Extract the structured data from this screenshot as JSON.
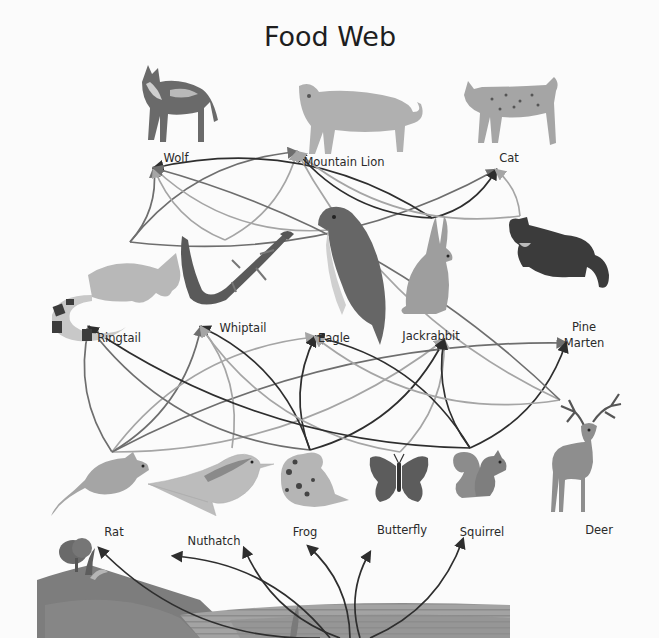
{
  "title": "Food Web",
  "colors": {
    "background": "#fbfbfb",
    "dark": "#3a3a3a",
    "mid": "#777777",
    "light": "#a9a9a9",
    "ground": "#7c7c7c",
    "water": "#9a9a9a"
  },
  "organisms": [
    {
      "id": "wolf",
      "label": "Wolf",
      "level": "top-predator",
      "icon": "wolf-icon"
    },
    {
      "id": "mountain_lion",
      "label": "Mountain Lion",
      "level": "top-predator",
      "icon": "mountain-lion-icon"
    },
    {
      "id": "cat",
      "label": "Cat",
      "level": "top-predator",
      "icon": "cat-icon"
    },
    {
      "id": "ringtail",
      "label": "Ringtail",
      "level": "secondary-consumer",
      "icon": "ringtail-icon"
    },
    {
      "id": "whiptail",
      "label": "Whiptail",
      "level": "secondary-consumer",
      "icon": "whiptail-lizard-icon"
    },
    {
      "id": "eagle",
      "label": "Eagle",
      "level": "secondary-consumer",
      "icon": "eagle-icon"
    },
    {
      "id": "jackrabbit",
      "label": "Jackrabbit",
      "level": "secondary-consumer",
      "icon": "jackrabbit-icon"
    },
    {
      "id": "pine_marten",
      "label": "Pine Marten",
      "label_lines": [
        "Pine",
        "Marten"
      ],
      "level": "secondary-consumer",
      "icon": "pine-marten-icon"
    },
    {
      "id": "rat",
      "label": "Rat",
      "level": "primary-consumer",
      "icon": "rat-icon"
    },
    {
      "id": "nuthatch",
      "label": "Nuthatch",
      "level": "primary-consumer",
      "icon": "nuthatch-icon"
    },
    {
      "id": "frog",
      "label": "Frog",
      "level": "primary-consumer",
      "icon": "frog-icon"
    },
    {
      "id": "butterfly",
      "label": "Butterfly",
      "level": "primary-consumer",
      "icon": "butterfly-icon"
    },
    {
      "id": "squirrel",
      "label": "Squirrel",
      "level": "primary-consumer",
      "icon": "squirrel-icon"
    },
    {
      "id": "deer",
      "label": "Deer",
      "level": "primary-consumer",
      "icon": "deer-icon"
    },
    {
      "id": "plants",
      "label": "",
      "level": "producer",
      "icon": "plants-landscape-icon"
    }
  ],
  "links": [
    {
      "from": "plants",
      "to": "rat",
      "shade": "dark"
    },
    {
      "from": "plants",
      "to": "nuthatch",
      "shade": "dark"
    },
    {
      "from": "plants",
      "to": "frog",
      "shade": "dark"
    },
    {
      "from": "plants",
      "to": "butterfly",
      "shade": "dark"
    },
    {
      "from": "plants",
      "to": "squirrel",
      "shade": "dark"
    },
    {
      "from": "plants",
      "to": "deer",
      "shade": "dark"
    },
    {
      "from": "rat",
      "to": "ringtail",
      "shade": "mid"
    },
    {
      "from": "rat",
      "to": "whiptail",
      "shade": "mid"
    },
    {
      "from": "rat",
      "to": "eagle",
      "shade": "light"
    },
    {
      "from": "rat",
      "to": "jackrabbit",
      "shade": "light"
    },
    {
      "from": "rat",
      "to": "pine_marten",
      "shade": "mid"
    },
    {
      "from": "nuthatch",
      "to": "whiptail",
      "shade": "light"
    },
    {
      "from": "frog",
      "to": "ringtail",
      "shade": "mid"
    },
    {
      "from": "frog",
      "to": "whiptail",
      "shade": "dark"
    },
    {
      "from": "frog",
      "to": "eagle",
      "shade": "dark"
    },
    {
      "from": "frog",
      "to": "jackrabbit",
      "shade": "dark"
    },
    {
      "from": "butterfly",
      "to": "whiptail",
      "shade": "light"
    },
    {
      "from": "butterfly",
      "to": "jackrabbit",
      "shade": "light"
    },
    {
      "from": "squirrel",
      "to": "ringtail",
      "shade": "dark"
    },
    {
      "from": "squirrel",
      "to": "eagle",
      "shade": "dark"
    },
    {
      "from": "squirrel",
      "to": "jackrabbit",
      "shade": "dark"
    },
    {
      "from": "squirrel",
      "to": "pine_marten",
      "shade": "dark"
    },
    {
      "from": "deer",
      "to": "eagle",
      "shade": "light"
    },
    {
      "from": "ringtail",
      "to": "wolf",
      "shade": "mid"
    },
    {
      "from": "ringtail",
      "to": "mountain_lion",
      "shade": "mid"
    },
    {
      "from": "ringtail",
      "to": "cat",
      "shade": "mid"
    },
    {
      "from": "whiptail",
      "to": "wolf",
      "shade": "light"
    },
    {
      "from": "whiptail",
      "to": "mountain_lion",
      "shade": "light"
    },
    {
      "from": "eagle",
      "to": "wolf",
      "shade": "light"
    },
    {
      "from": "jackrabbit",
      "to": "wolf",
      "shade": "dark"
    },
    {
      "from": "jackrabbit",
      "to": "mountain_lion",
      "shade": "dark"
    },
    {
      "from": "jackrabbit",
      "to": "cat",
      "shade": "dark"
    },
    {
      "from": "pine_marten",
      "to": "mountain_lion",
      "shade": "light"
    },
    {
      "from": "pine_marten",
      "to": "cat",
      "shade": "light"
    },
    {
      "from": "deer",
      "to": "mountain_lion",
      "shade": "light"
    },
    {
      "from": "deer",
      "to": "wolf",
      "shade": "mid"
    }
  ]
}
